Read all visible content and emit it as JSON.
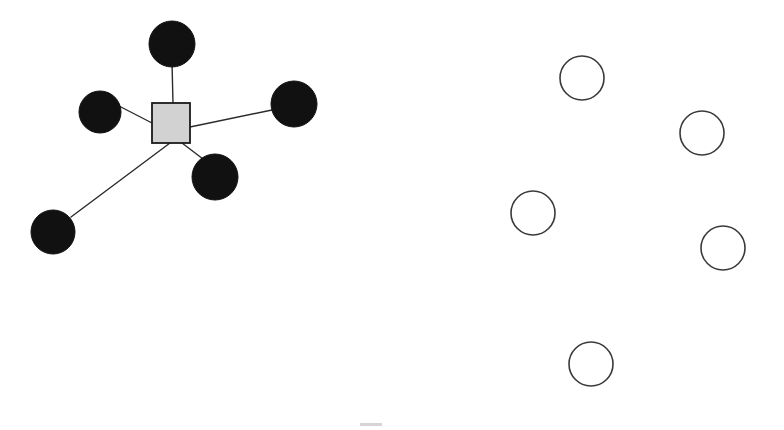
{
  "canvas": {
    "width": 784,
    "height": 430,
    "background": "#ffffff",
    "title": "Star graph with hub node and five connected leaf nodes beside five unconnected outline nodes"
  },
  "style": {
    "filled_node_fill": "#111111",
    "filled_node_stroke": "#111111",
    "open_node_fill": "#ffffff",
    "open_node_stroke": "#3a3a3a",
    "open_node_stroke_width": 1.6,
    "hub_fill": "#d2d2d2",
    "hub_stroke": "#1a1a1a",
    "hub_stroke_width": 1.8,
    "edge_stroke": "#2b2b2b",
    "edge_stroke_width": 1.4
  },
  "graph": {
    "hub": {
      "id": "hub-square",
      "label": "",
      "shape": "square",
      "x": 152,
      "y": 103,
      "width": 38,
      "height": 40,
      "center_x": 171,
      "center_y": 123
    },
    "connected_nodes": [
      {
        "id": "leaf-top",
        "label": "",
        "shape": "circle",
        "cx": 172,
        "cy": 44,
        "r": 23
      },
      {
        "id": "leaf-upper-left",
        "label": "",
        "shape": "circle",
        "cx": 100,
        "cy": 112,
        "r": 21
      },
      {
        "id": "leaf-right",
        "label": "",
        "shape": "circle",
        "cx": 294,
        "cy": 104,
        "r": 23
      },
      {
        "id": "leaf-lower-right",
        "label": "",
        "shape": "circle",
        "cx": 215,
        "cy": 177,
        "r": 23
      },
      {
        "id": "leaf-lower-left",
        "label": "",
        "shape": "circle",
        "cx": 53,
        "cy": 232,
        "r": 22
      }
    ],
    "edges": [
      {
        "id": "edge-hub-top",
        "from": "hub-square",
        "to": "leaf-top",
        "x1": 173,
        "y1": 104,
        "x2": 172,
        "y2": 62
      },
      {
        "id": "edge-hub-upper-left",
        "from": "hub-square",
        "to": "leaf-upper-left",
        "x1": 152,
        "y1": 123,
        "x2": 119,
        "y2": 106
      },
      {
        "id": "edge-hub-right",
        "from": "hub-square",
        "to": "leaf-right",
        "x1": 190,
        "y1": 127,
        "x2": 272,
        "y2": 110
      },
      {
        "id": "edge-hub-lower-right",
        "from": "hub-square",
        "to": "leaf-lower-right",
        "x1": 182,
        "y1": 143,
        "x2": 203,
        "y2": 159
      },
      {
        "id": "edge-hub-lower-left",
        "from": "hub-square",
        "to": "leaf-lower-left",
        "x1": 170,
        "y1": 143,
        "x2": 71,
        "y2": 217
      }
    ],
    "unconnected_nodes": [
      {
        "id": "open-node-1",
        "label": "",
        "shape": "circle",
        "cx": 582,
        "cy": 78,
        "r": 22
      },
      {
        "id": "open-node-2",
        "label": "",
        "shape": "circle",
        "cx": 702,
        "cy": 133,
        "r": 22
      },
      {
        "id": "open-node-3",
        "label": "",
        "shape": "circle",
        "cx": 533,
        "cy": 213,
        "r": 22
      },
      {
        "id": "open-node-4",
        "label": "",
        "shape": "circle",
        "cx": 723,
        "cy": 248,
        "r": 22
      },
      {
        "id": "open-node-5",
        "label": "",
        "shape": "circle",
        "cx": 591,
        "cy": 364,
        "r": 22
      }
    ],
    "artifacts": [
      {
        "id": "smudge-bottom",
        "x": 360,
        "y": 423,
        "width": 22,
        "height": 3,
        "color": "#bfbfbf"
      }
    ]
  },
  "counts": {
    "connected_nodes": 5,
    "unconnected_nodes": 5,
    "edges": 5,
    "hubs": 1
  }
}
